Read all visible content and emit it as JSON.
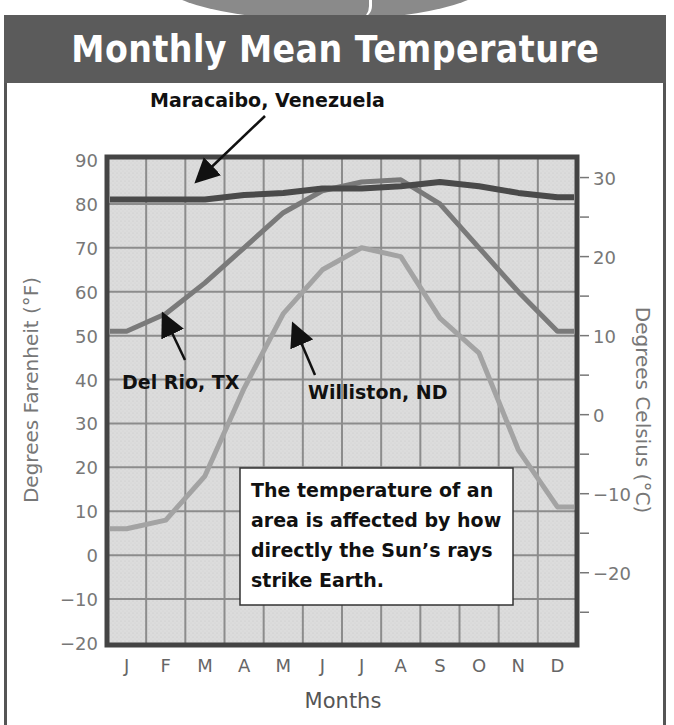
{
  "title": "Monthly Mean Temperature",
  "annotations": {
    "maracaibo": "Maracaibo, Venezuela",
    "del_rio": "Del Rio, TX",
    "williston": "Williston, ND"
  },
  "callout": {
    "lines": [
      "The temperature of an",
      "area is affected by how",
      "directly the Sun’s rays",
      "strike Earth."
    ]
  },
  "axes": {
    "left_label": "Degrees Farenheit (°F)",
    "right_label": "Degrees Celsius (°C)",
    "x_label": "Months"
  },
  "chart_data": {
    "type": "line",
    "title": "Monthly Mean Temperature",
    "xlabel": "Months",
    "ylabel": "Degrees Farenheit (°F)",
    "ylabel_right": "Degrees Celsius (°C)",
    "categories": [
      "J",
      "F",
      "M",
      "A",
      "M",
      "J",
      "J",
      "A",
      "S",
      "O",
      "N",
      "D"
    ],
    "ylim": [
      -20,
      90
    ],
    "yticks": [
      90,
      80,
      70,
      60,
      50,
      40,
      30,
      20,
      10,
      0,
      -10,
      -20
    ],
    "yticks_right": [
      30,
      20,
      10,
      0,
      -10,
      -20
    ],
    "grid": true,
    "legend": "inline annotations with arrows",
    "series": [
      {
        "name": "Maracaibo, Venezuela",
        "color": "#4a4a4a",
        "values": [
          81,
          81,
          81,
          82,
          82.5,
          83.5,
          83.5,
          84,
          85,
          84,
          82.5,
          81.5
        ]
      },
      {
        "name": "Del Rio, TX",
        "color": "#7a7a7a",
        "values": [
          51,
          55,
          62,
          70,
          78,
          83,
          85,
          85.5,
          80,
          70,
          60,
          51
        ]
      },
      {
        "name": "Williston, ND",
        "color": "#a3a3a3",
        "values": [
          6,
          8,
          18,
          38,
          55,
          65,
          70,
          68,
          54,
          46,
          24,
          11
        ]
      }
    ],
    "annotation_text": "The temperature of an area is affected by how directly the Sun’s rays strike Earth."
  }
}
